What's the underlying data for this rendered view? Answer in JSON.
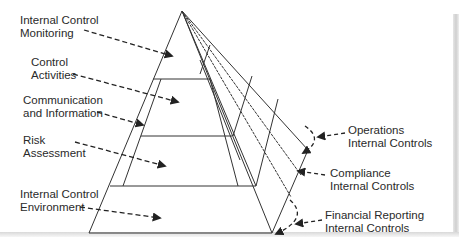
{
  "diagram": {
    "title": "",
    "type": "pyramid",
    "layers_left": [
      {
        "id": "monitoring",
        "line1": "Internal Control",
        "line2": "Monitoring"
      },
      {
        "id": "activities",
        "line1": "Control",
        "line2": "Activities"
      },
      {
        "id": "communication",
        "line1": "Communication",
        "line2": "and Information"
      },
      {
        "id": "risk",
        "line1": "Risk",
        "line2": "Assessment"
      },
      {
        "id": "environment",
        "line1": "Internal Control",
        "line2": "Environment"
      }
    ],
    "faces_right": [
      {
        "id": "operations",
        "line1": "Operations",
        "line2": "Internal Controls"
      },
      {
        "id": "compliance",
        "line1": "Compliance",
        "line2": "Internal Controls"
      },
      {
        "id": "financial",
        "line1": "Financial Reporting",
        "line2": "Internal Controls"
      }
    ],
    "colors": {
      "line": "#333333",
      "text": "#2a2a2a",
      "background": "#ffffff",
      "shadow": "#d4d4d4"
    }
  }
}
